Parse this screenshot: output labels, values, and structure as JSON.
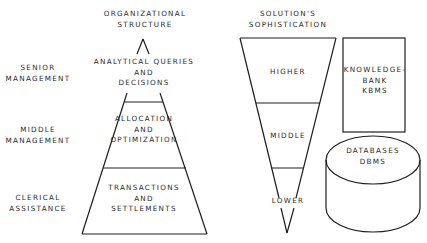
{
  "titles": {
    "organizational": [
      "ORGANIZATIONAL",
      "STRUCTURE"
    ],
    "solution": [
      "SOLUTION'S",
      "SOPHISTICATION"
    ]
  },
  "levels": [
    {
      "name": [
        "SENIOR",
        "MANAGEMENT"
      ]
    },
    {
      "name": [
        "MIDDLE",
        "MANAGEMENT"
      ]
    },
    {
      "name": [
        "CLERICAL",
        "ASSISTANCE"
      ]
    }
  ],
  "pyramid": [
    {
      "text": [
        "ANALYTICAL QUERIES",
        "AND",
        "DECISIONS"
      ]
    },
    {
      "text": [
        "ALLOCATION",
        "AND",
        "OPTIMIZATION"
      ]
    },
    {
      "text": [
        "TRANSACTIONS",
        "AND",
        "SETTLEMENTS"
      ]
    }
  ],
  "funnel": [
    {
      "text": "HIGHER"
    },
    {
      "text": "MIDDLE"
    },
    {
      "text": "LOWER"
    }
  ],
  "knowledge_bank": [
    "KNOWLEDGE-",
    "BANK",
    "KBMS"
  ],
  "databases": [
    "DATABASES",
    "DBMS"
  ]
}
